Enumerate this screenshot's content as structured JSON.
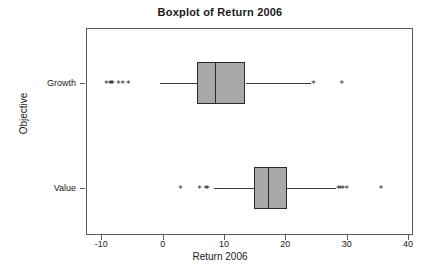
{
  "chart_data": {
    "type": "boxplot",
    "title": "Boxplot of Return 2006",
    "xlabel": "Return 2006",
    "ylabel": "Objective",
    "xlim": [
      -12.5,
      40.8
    ],
    "xticks": [
      -10,
      0,
      10,
      20,
      30,
      40
    ],
    "xticklabels": [
      "-10",
      "0",
      "10",
      "20",
      "30",
      "40"
    ],
    "categories": [
      "Growth",
      "Value"
    ],
    "grid": false,
    "legend": null,
    "orientation": "horizontal",
    "box_fill": "#a8a8a8",
    "box_edge": "#2b2b2b",
    "outlier_marker": "*",
    "boxes": [
      {
        "category": "Growth",
        "whisker_low": -0.5,
        "q1": 5.6,
        "median": 8.6,
        "q3": 13.5,
        "whisker_high": 24.1,
        "outliers": [
          -9.2,
          -8.6,
          -8.4,
          -8.2,
          -7.2,
          -6.5,
          -5.6,
          24.6,
          29.2
        ]
      },
      {
        "category": "Value",
        "whisker_low": 8.3,
        "q1": 14.9,
        "median": 17.1,
        "q3": 20.2,
        "whisker_high": 28.3,
        "outliers": [
          2.9,
          6.0,
          7.0,
          7.3,
          28.6,
          29.0,
          29.4,
          30.0,
          35.6
        ]
      }
    ]
  }
}
